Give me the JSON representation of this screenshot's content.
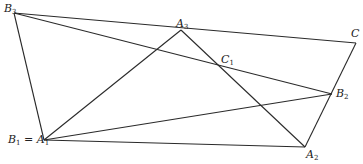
{
  "diagram": {
    "type": "geometry",
    "points": {
      "B3": {
        "x": 14,
        "y": 13,
        "label": "B",
        "sub": "3"
      },
      "A3": {
        "x": 181,
        "y": 30,
        "label": "A",
        "sub": "3"
      },
      "C": {
        "x": 356,
        "y": 43,
        "label": "C",
        "sub": ""
      },
      "C1": {
        "x": 222,
        "y": 67,
        "label": "C",
        "sub": "1"
      },
      "B2": {
        "x": 332,
        "y": 94,
        "label": "B",
        "sub": "2"
      },
      "A1": {
        "x": 44,
        "y": 140,
        "label": "B₁ = A",
        "sub": "1"
      },
      "A2": {
        "x": 305,
        "y": 147,
        "label": "A",
        "sub": "2"
      }
    },
    "segments": [
      [
        "B3",
        "C"
      ],
      [
        "B3",
        "B2"
      ],
      [
        "B3",
        "A1"
      ],
      [
        "A1",
        "A3"
      ],
      [
        "A3",
        "A2"
      ],
      [
        "A1",
        "B2"
      ],
      [
        "A1",
        "A2"
      ],
      [
        "C",
        "A2"
      ]
    ],
    "stroke_color": "#2a2a2a"
  },
  "labels": {
    "B3": {
      "main": "B",
      "sub": "3"
    },
    "A3": {
      "main": "A",
      "sub": "3"
    },
    "C": {
      "main": "C",
      "sub": ""
    },
    "C1": {
      "main": "C",
      "sub": "1"
    },
    "B2": {
      "main": "B",
      "sub": "2"
    },
    "B1A1": {
      "main": "B",
      "sub": "1",
      "eq": " = A",
      "sub2": "1"
    },
    "A2": {
      "main": "A",
      "sub": "2"
    }
  }
}
